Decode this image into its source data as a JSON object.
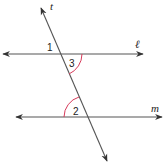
{
  "diagram": {
    "type": "parallel-lines-cut-by-transversal",
    "colors": {
      "line": "#555555",
      "arrow": "#333333",
      "arc": "#d63a5a",
      "label": "#222222",
      "background": "#ffffff"
    },
    "lines": {
      "l": {
        "label": "ℓ",
        "label_pos": [
          137,
          47
        ]
      },
      "m": {
        "label": "m",
        "label_pos": [
          155,
          111
        ]
      },
      "t": {
        "label": "t",
        "label_pos": [
          50,
          10
        ]
      }
    },
    "angles": [
      {
        "id": "angle-1",
        "label": "1",
        "pos": [
          48,
          50
        ]
      },
      {
        "id": "angle-3",
        "label": "3",
        "pos": [
          70,
          65
        ]
      },
      {
        "id": "angle-2",
        "label": "2",
        "pos": [
          73,
          116
        ]
      }
    ]
  }
}
